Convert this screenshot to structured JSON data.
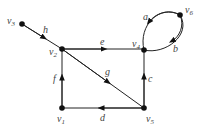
{
  "diagram": {
    "type": "directed-graph",
    "nodes": [
      {
        "id": "v1",
        "label": "v",
        "sub": "1",
        "x": 62,
        "y": 108
      },
      {
        "id": "v2",
        "label": "v",
        "sub": "2",
        "x": 62,
        "y": 49
      },
      {
        "id": "v3",
        "label": "v",
        "sub": "3",
        "x": 22,
        "y": 24
      },
      {
        "id": "v4",
        "label": "v",
        "sub": "4",
        "x": 144,
        "y": 50
      },
      {
        "id": "v5",
        "label": "v",
        "sub": "5",
        "x": 144,
        "y": 108
      },
      {
        "id": "v6",
        "label": "v",
        "sub": "6",
        "x": 180,
        "y": 15
      }
    ],
    "edges": [
      {
        "id": "a",
        "label": "a",
        "from": "v6",
        "to": "v4"
      },
      {
        "id": "b",
        "label": "b",
        "from": "v6",
        "to": "v4"
      },
      {
        "id": "c",
        "label": "c",
        "from": "v5",
        "to": "v4"
      },
      {
        "id": "d",
        "label": "d",
        "from": "v5",
        "to": "v1"
      },
      {
        "id": "e",
        "label": "e",
        "from": "v2",
        "to": "v4"
      },
      {
        "id": "f",
        "label": "f",
        "from": "v1",
        "to": "v2"
      },
      {
        "id": "g",
        "label": "g",
        "from": "v2",
        "to": "v5"
      },
      {
        "id": "h",
        "label": "h",
        "from": "v3",
        "to": "v2"
      }
    ]
  }
}
